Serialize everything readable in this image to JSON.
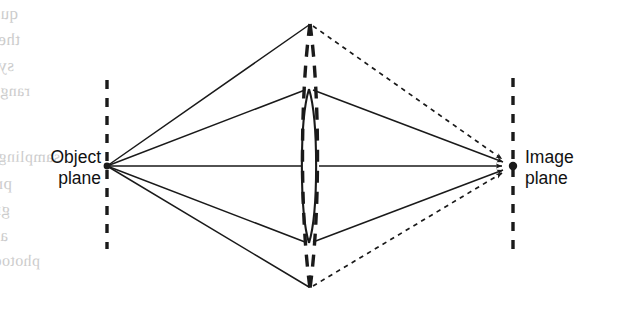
{
  "figure": {
    "kind": "optical-ray-diagram",
    "width": 623,
    "height": 316,
    "background_color": "#ffffff",
    "ink_color": "#1a1a1a"
  },
  "labels": {
    "object_plane": {
      "line1": "Object",
      "line2": "plane"
    },
    "image_plane": {
      "line1": "Image",
      "line2": "plane"
    }
  },
  "geometry": {
    "object_point": {
      "x": 107,
      "y": 166
    },
    "image_point": {
      "x": 505,
      "y": 166
    },
    "image_plane_dot": {
      "x": 513,
      "y": 166
    },
    "object_plane_line": {
      "x": 107,
      "y_top": 80,
      "y_bottom": 249
    },
    "image_plane_line": {
      "x": 513,
      "y_top": 78,
      "y_bottom": 251
    },
    "small_lens": {
      "center_x": 309,
      "top_y": 89,
      "bottom_y": 243,
      "half_width": 9.5,
      "style": "solid"
    },
    "large_lens": {
      "center_x": 310,
      "top_y": 24,
      "bottom_y": 288,
      "half_width": 9.5,
      "style": "dashed"
    },
    "solid_rays_object_side": [
      {
        "to_x": 310,
        "to_y": 24
      },
      {
        "to_x": 305,
        "to_y": 89
      },
      {
        "to_x": 300,
        "to_y": 166
      },
      {
        "to_x": 305,
        "to_y": 243
      },
      {
        "to_x": 310,
        "to_y": 288
      }
    ],
    "solid_rays_image_side": [
      {
        "from_x": 313,
        "from_y": 89
      },
      {
        "from_x": 319,
        "from_y": 166
      },
      {
        "from_x": 313,
        "from_y": 243
      }
    ],
    "dotted_rays_image_side": [
      {
        "from_x": 313,
        "from_y": 24
      },
      {
        "from_x": 313,
        "from_y": 288
      }
    ]
  },
  "bleed_through_text": {
    "note": "Faint mirrored show-through from the reverse side of the scanned page.",
    "lines": [
      {
        "text": "quality sharp the degrades that noise",
        "x": 18,
        "y": 4,
        "size": 17,
        "rotate": -0.6
      },
      {
        "text": "the narrower be to it forces velocity",
        "x": 20,
        "y": 30,
        "size": 17,
        "rotate": -0.4
      },
      {
        "text": "system the optical narrow very a and",
        "x": 14,
        "y": 56,
        "size": 17,
        "rotate": -0.3
      },
      {
        "text": "range transfer of curve spatial",
        "x": 30,
        "y": 82,
        "size": 16,
        "rotate": -0.2
      },
      {
        "text": "sampling the situation, this in",
        "x": 60,
        "y": 148,
        "size": 16,
        "rotate": 0.2
      },
      {
        "text": "prevents it optical resolution, necked image",
        "x": 12,
        "y": 174,
        "size": 17,
        "rotate": 0.3
      },
      {
        "text": "grid by determined intrinsically is image, of limits",
        "x": 10,
        "y": 200,
        "size": 17,
        "rotate": 0.4
      },
      {
        "text": "apart, spaced sensor of spaces power of series",
        "x": 8,
        "y": 226,
        "size": 17,
        "rotate": 0.5
      },
      {
        "text": "photodetector the of",
        "x": 40,
        "y": 252,
        "size": 16,
        "rotate": 0.5
      }
    ]
  }
}
